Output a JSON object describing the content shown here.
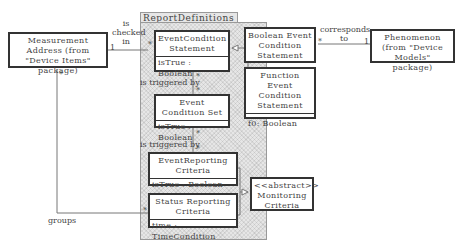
{
  "package": {
    "title": "ReportDefinitions"
  },
  "classes": {
    "measurement_address": {
      "name": "Measurement Address (from \"Device Items\" package)"
    },
    "phenomenon": {
      "name": "Phenomenon (from \"Device Models\" package)"
    },
    "event_condition_statement": {
      "name": "EventCondition Statement",
      "attr": "isTrue : Boolean"
    },
    "boolean_event": {
      "name": "Boolean Event Condition Statement"
    },
    "function_event": {
      "name": "Function Event Condition Statement",
      "attr": "f0: Boolean"
    },
    "event_condition_set": {
      "name": "Event Condition Set",
      "attr": "isTrue : Boolean"
    },
    "event_reporting": {
      "name": "EventReporting Criteria",
      "attr": "isTrue : Boolean"
    },
    "status_reporting": {
      "name": "Status Reporting Criteria",
      "attr": "time : TimeCondition"
    },
    "monitoring": {
      "stereotype": "<<abstract>>",
      "name": "Monitoring Criteria"
    }
  },
  "associations": {
    "is_checked_in": {
      "label": "is checked in",
      "mult_left": "1",
      "mult_right": "*"
    },
    "corresponds_to": {
      "label": "corresponds to",
      "mult_left": "*",
      "mult_right": "1"
    },
    "triggered_by_1": {
      "label": "is triggered by",
      "mult_top": "*",
      "mult_bottom": "*"
    },
    "triggered_by_2": {
      "label": "is triggered by",
      "mult_top": "*",
      "mult_bottom": "*"
    },
    "groups": {
      "label": "groups",
      "mult_top": "*",
      "mult_end": "*"
    }
  }
}
